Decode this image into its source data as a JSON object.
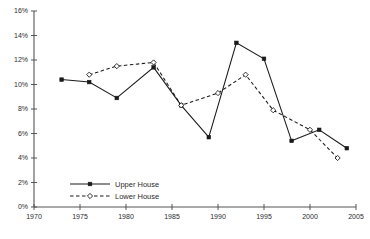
{
  "chart_data": {
    "type": "line",
    "title": "",
    "xlabel": "",
    "ylabel": "",
    "xlim": [
      1970,
      2005
    ],
    "ylim": [
      0,
      16
    ],
    "grid": false,
    "legend_position": "bottom-left",
    "y_tick_labels": [
      "0%",
      "2%",
      "4%",
      "6%",
      "8%",
      "10%",
      "12%",
      "14%",
      "16%"
    ],
    "y_tick_values": [
      0,
      2,
      4,
      6,
      8,
      10,
      12,
      14,
      16
    ],
    "x_tick_labels": [
      "1970",
      "1975",
      "1980",
      "1985",
      "1990",
      "1995",
      "2000",
      "2005"
    ],
    "x_tick_values": [
      1970,
      1975,
      1980,
      1985,
      1990,
      1995,
      2000,
      2005
    ],
    "series": [
      {
        "name": "Upper House",
        "style": "solid",
        "marker": "filled-square",
        "color": "#1a1a1a",
        "x": [
          1973,
          1976,
          1979,
          1983,
          1986,
          1989,
          1992,
          1995,
          1998,
          2001,
          2004
        ],
        "values": [
          10.4,
          10.2,
          8.9,
          11.4,
          8.3,
          5.7,
          13.4,
          12.1,
          5.4,
          6.3,
          4.8
        ]
      },
      {
        "name": "Lower House",
        "style": "dashed",
        "marker": "open-diamond",
        "color": "#1a1a1a",
        "x": [
          1976,
          1979,
          1983,
          1986,
          1990,
          1993,
          1996,
          2000,
          2003
        ],
        "values": [
          10.8,
          11.5,
          11.8,
          8.3,
          9.3,
          10.8,
          7.9,
          6.3,
          4.0
        ]
      }
    ]
  },
  "legend": {
    "items": [
      {
        "label": "Upper House"
      },
      {
        "label": "Lower House"
      }
    ]
  }
}
